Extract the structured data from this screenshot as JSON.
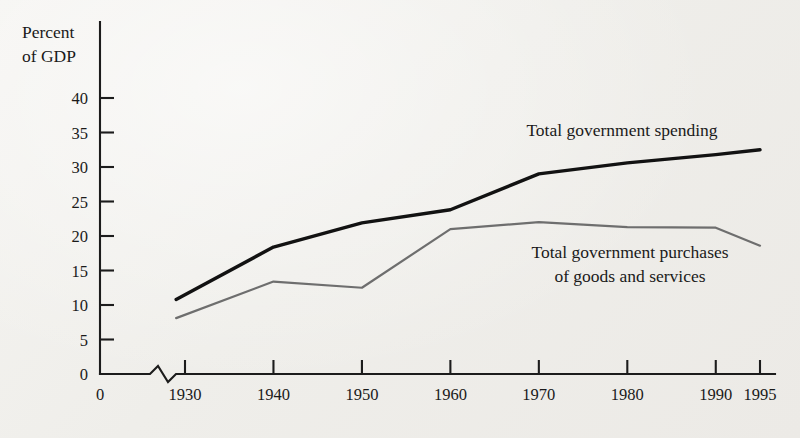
{
  "chart_data": {
    "type": "line",
    "title": "",
    "xlabel": "",
    "ylabel": "Percent of GDP",
    "ylabel_line1": "Percent",
    "ylabel_line2": "of GDP",
    "x": [
      1929,
      1940,
      1950,
      1960,
      1970,
      1980,
      1990,
      1995
    ],
    "categories": [
      "1930",
      "1940",
      "1950",
      "1960",
      "1970",
      "1980",
      "1990",
      "1995"
    ],
    "xtick_labels": [
      "1930",
      "1940",
      "1950",
      "1960",
      "1970",
      "1980",
      "1990",
      "1995"
    ],
    "xtick_values": [
      1930,
      1940,
      1950,
      1960,
      1970,
      1980,
      1990,
      1995
    ],
    "origin_label": "0",
    "ytick_labels": [
      "0",
      "5",
      "10",
      "15",
      "20",
      "25",
      "30",
      "35",
      "40"
    ],
    "ytick_values": [
      0,
      5,
      10,
      15,
      20,
      25,
      30,
      35,
      40
    ],
    "ylim": [
      0,
      40
    ],
    "xlim": [
      1929,
      1995
    ],
    "axis_break": true,
    "grid": false,
    "legend_position": "inline-annotation",
    "series": [
      {
        "name": "Total government spending",
        "color": "#121212",
        "x": [
          1929,
          1940,
          1950,
          1960,
          1970,
          1980,
          1990,
          1995
        ],
        "values": [
          10.8,
          18.4,
          21.9,
          23.8,
          29.0,
          30.6,
          31.8,
          32.5
        ],
        "annotation": "Total government spending"
      },
      {
        "name": "Total government purchases of goods and services",
        "color": "#6e6e6e",
        "x": [
          1929,
          1940,
          1950,
          1960,
          1970,
          1980,
          1990,
          1995
        ],
        "values": [
          8.1,
          13.4,
          12.5,
          21.0,
          22.0,
          21.3,
          21.2,
          18.6
        ],
        "annotation_line1": "Total government purchases",
        "annotation_line2": "of goods and services"
      }
    ]
  },
  "colors": {
    "background": "#f2f1ee",
    "axis": "#1c1c1c",
    "spending_line": "#121212",
    "purchases_line": "#6e6e6e",
    "text": "#1a1a1a"
  }
}
